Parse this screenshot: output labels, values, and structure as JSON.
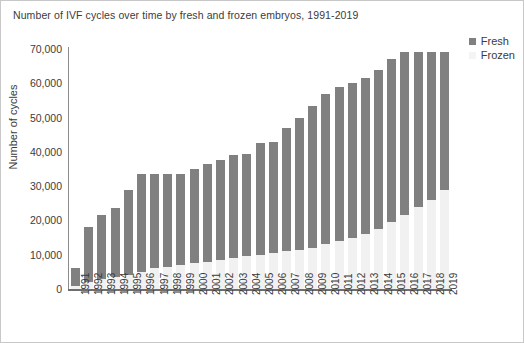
{
  "chart_data": {
    "type": "bar",
    "title": "Number of IVF cycles over time by fresh and frozen embryos, 1991-2019",
    "xlabel": "",
    "ylabel": "Number of cycles",
    "ylim": [
      0,
      70000
    ],
    "ytick_step": 10000,
    "ytick_labels": [
      "70,000",
      "60,000",
      "50,000",
      "40,000",
      "30,000",
      "20,000",
      "10,000",
      "0"
    ],
    "ytick_values": [
      70000,
      60000,
      50000,
      40000,
      30000,
      20000,
      10000,
      0
    ],
    "grid": false,
    "stacked": true,
    "legend_position": "top-right",
    "categories": [
      "1991",
      "1992",
      "1993",
      "1994",
      "1995",
      "1996",
      "1997",
      "1998",
      "1999",
      "2000",
      "2001",
      "2002",
      "2003",
      "2004",
      "2005",
      "2006",
      "2007",
      "2008",
      "2009",
      "2010",
      "2011",
      "2012",
      "2013",
      "2014",
      "2015",
      "2016",
      "2017",
      "2018",
      "2019"
    ],
    "series": [
      {
        "name": "Frozen",
        "color": "#f1f1f1",
        "values": [
          1000,
          2000,
          3000,
          3500,
          4000,
          5000,
          6000,
          6500,
          7000,
          7500,
          8000,
          8500,
          9000,
          9500,
          10000,
          10500,
          11000,
          11500,
          12000,
          13000,
          14000,
          15000,
          16000,
          17500,
          19500,
          21500,
          24000,
          26000,
          29000
        ]
      },
      {
        "name": "Fresh",
        "color": "#808080",
        "values": [
          5000,
          16000,
          18500,
          20000,
          25000,
          28500,
          27500,
          27000,
          26500,
          27500,
          28500,
          29000,
          30000,
          30000,
          32500,
          32500,
          36000,
          38500,
          41500,
          44000,
          45000,
          45000,
          45500,
          46500,
          47500,
          47500,
          45000,
          43000,
          40000
        ]
      }
    ],
    "totals": [
      6000,
      18000,
      21500,
      23500,
      29000,
      33500,
      33500,
      33500,
      33500,
      35000,
      36500,
      37500,
      39000,
      39500,
      42500,
      43000,
      47000,
      50000,
      53500,
      57000,
      59000,
      60000,
      61500,
      64000,
      67000,
      69000,
      69000,
      69000,
      69000
    ]
  },
  "legend": {
    "items": [
      {
        "label": "Fresh",
        "color": "#808080"
      },
      {
        "label": "Frozen",
        "color": "#f4f4f4"
      }
    ]
  }
}
